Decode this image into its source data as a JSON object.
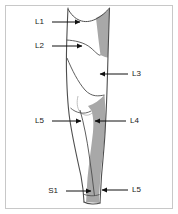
{
  "figure": {
    "view": "anterior-lateral right lower limb",
    "border_color": "#c8c8c8",
    "background_color": "#ffffff",
    "outline_color": "#4d4d4d",
    "shading_color": "#a8a8a8",
    "label_color": "#1a1a1a",
    "leader_color": "#1a1a1a"
  },
  "labels": [
    {
      "id": "L1",
      "text": "L1",
      "text_x": 44,
      "text_y": 22,
      "side": "left",
      "arrow_from_x": 52,
      "arrow_to_x": 82,
      "arrow_y": 22
    },
    {
      "id": "L2",
      "text": "L2",
      "text_x": 44,
      "text_y": 46,
      "side": "left",
      "arrow_from_x": 52,
      "arrow_to_x": 84,
      "arrow_y": 46
    },
    {
      "id": "L3",
      "text": "L3",
      "text_x": 132,
      "text_y": 74,
      "side": "right",
      "arrow_from_x": 128,
      "arrow_to_x": 98,
      "arrow_y": 74
    },
    {
      "id": "L4",
      "text": "L4",
      "text_x": 130,
      "text_y": 121,
      "side": "right",
      "arrow_from_x": 126,
      "arrow_to_x": 93,
      "arrow_y": 121
    },
    {
      "id": "L5-mid",
      "text": "L5",
      "text_x": 44,
      "text_y": 121,
      "side": "left",
      "arrow_from_x": 52,
      "arrow_to_x": 83,
      "arrow_y": 121
    },
    {
      "id": "L5-ankle",
      "text": "L5",
      "text_x": 132,
      "text_y": 190,
      "side": "right",
      "arrow_from_x": 128,
      "arrow_to_x": 100,
      "arrow_y": 190
    },
    {
      "id": "S1",
      "text": "S1",
      "text_x": 58,
      "text_y": 191,
      "side": "left",
      "arrow_from_x": 66,
      "arrow_to_x": 93,
      "arrow_y": 191
    }
  ],
  "regions": [
    {
      "name": "lateral-thigh-shaded",
      "dermatome": "L2"
    },
    {
      "name": "lateral-leg-shaded",
      "dermatome": "L4-L5"
    }
  ]
}
